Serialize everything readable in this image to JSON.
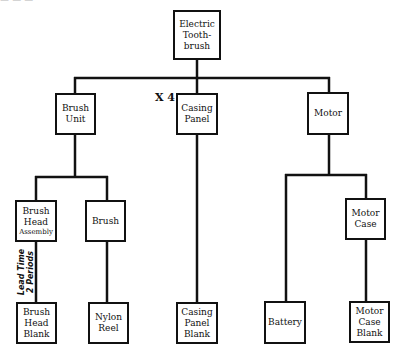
{
  "clipped_top_text": "— — —",
  "nodes": {
    "root": {
      "lines": [
        "Electric",
        "Tooth-",
        "brush"
      ]
    },
    "brush_unit": {
      "lines": [
        "Brush",
        "Unit"
      ]
    },
    "casing_panel": {
      "lines": [
        "Casing",
        "Panel"
      ],
      "quantity": "X 4"
    },
    "motor": {
      "lines": [
        "Motor"
      ]
    },
    "brush_head_assembly": {
      "lines": [
        "Brush",
        "Head"
      ],
      "small_line": "Assembly"
    },
    "brush": {
      "lines": [
        "Brush"
      ]
    },
    "motor_case": {
      "lines": [
        "Motor",
        "Case"
      ]
    },
    "brush_head_blank": {
      "lines": [
        "Brush",
        "Head",
        "Blank"
      ]
    },
    "nylon_reel": {
      "lines": [
        "Nylon",
        "Reel"
      ]
    },
    "casing_panel_blank": {
      "lines": [
        "Casing",
        "Panel",
        "Blank"
      ]
    },
    "battery": {
      "lines": [
        "Battery"
      ]
    },
    "motor_case_blank": {
      "lines": [
        "Motor",
        "Case",
        "Blank"
      ]
    }
  },
  "annotations": {
    "lead_time": [
      "Lead Time",
      "2 Periods"
    ]
  },
  "colors": {
    "line": "#111111",
    "background": "#ffffff"
  }
}
